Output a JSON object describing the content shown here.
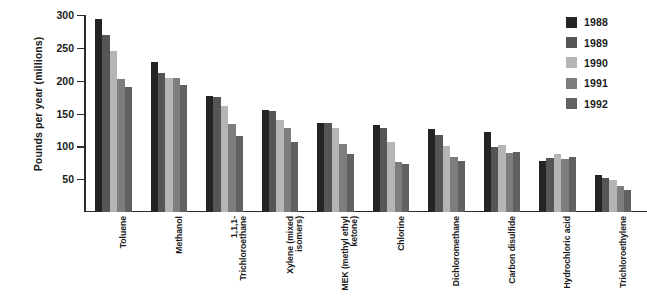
{
  "chart_data": {
    "type": "bar",
    "title": "",
    "xlabel": "",
    "ylabel": "Pounds per year (millions)",
    "ylim": [
      0,
      300
    ],
    "yticks": [
      50,
      100,
      150,
      200,
      250,
      300
    ],
    "grid": false,
    "legend_position": "right",
    "categories": [
      "Toluene",
      "Methanol",
      "1,1,1-Trichloroethane",
      "Xylene (mixed isomers)",
      "MEK (methyl ethyl ketone)",
      "Chlorine",
      "Dichloromethane",
      "Carbon disulfide",
      "Hydrochloric acid",
      "Trichloroethylene"
    ],
    "category_lines": [
      [
        "Toluene"
      ],
      [
        "Methanol"
      ],
      [
        "1,1,1-",
        "Trichloroethane"
      ],
      [
        "Xylene (mixed",
        "isomers)"
      ],
      [
        "MEK (methyl ethyl",
        "ketone)"
      ],
      [
        "Chlorine"
      ],
      [
        "Dichloromethane"
      ],
      [
        "Carbon disulfide"
      ],
      [
        "Hydrochloric acid"
      ],
      [
        "Trichloroethylene"
      ]
    ],
    "series": [
      {
        "name": "1988",
        "color": "#242424",
        "values": [
          294,
          229,
          177,
          156,
          135,
          133,
          127,
          122,
          77,
          57
        ]
      },
      {
        "name": "1989",
        "color": "#555555",
        "values": [
          270,
          211,
          175,
          154,
          135,
          128,
          118,
          99,
          83,
          52
        ]
      },
      {
        "name": "1990",
        "color": "#b5b5b5",
        "values": [
          245,
          204,
          162,
          140,
          128,
          106,
          101,
          102,
          88,
          48
        ]
      },
      {
        "name": "1991",
        "color": "#7d7d7d",
        "values": [
          203,
          204,
          134,
          128,
          103,
          76,
          84,
          90,
          80,
          39
        ]
      },
      {
        "name": "1992",
        "color": "#616161",
        "values": [
          190,
          194,
          115,
          107,
          89,
          73,
          77,
          91,
          84,
          33
        ]
      }
    ]
  },
  "legend": {
    "items": [
      {
        "label": "1988",
        "color": "#242424"
      },
      {
        "label": "1989",
        "color": "#555555"
      },
      {
        "label": "1990",
        "color": "#b5b5b5"
      },
      {
        "label": "1991",
        "color": "#7d7d7d"
      },
      {
        "label": "1992",
        "color": "#616161"
      }
    ]
  }
}
